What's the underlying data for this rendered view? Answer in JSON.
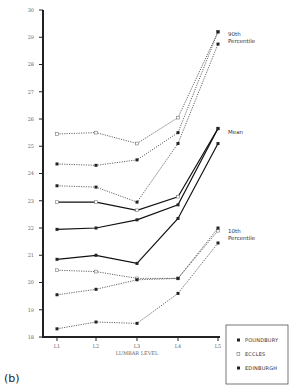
{
  "panel_label": "(b)",
  "chart_data": {
    "type": "line",
    "title": "",
    "xlabel": "LUMBAR LEVEL",
    "ylabel": "",
    "categories": [
      "L1",
      "L2",
      "L3",
      "L4",
      "L5"
    ],
    "ylim": [
      18,
      30
    ],
    "yticks": [
      18,
      19,
      20,
      21,
      22,
      23,
      24,
      25,
      26,
      27,
      28,
      29,
      30
    ],
    "grid": false,
    "legend": {
      "position": "bottom-right",
      "entries": [
        {
          "name": "POUNDBURY",
          "marker": "filled-square"
        },
        {
          "name": "ECCLES",
          "marker": "open-square"
        },
        {
          "name": "EDINBURGH",
          "marker": "filled-square"
        }
      ]
    },
    "annotations": [
      {
        "text_lines": [
          "90th",
          "Percentile"
        ],
        "group": "p90"
      },
      {
        "text_lines": [
          "Mean"
        ],
        "group": "mean"
      },
      {
        "text_lines": [
          "10th",
          "Percentile"
        ],
        "group": "p10"
      }
    ],
    "series": [
      {
        "name": "Eccles 90th",
        "site": "ECCLES",
        "group": "p90",
        "values": [
          25.45,
          25.5,
          25.1,
          26.05,
          29.2
        ]
      },
      {
        "name": "Poundbury 90th",
        "site": "POUNDBURY",
        "group": "p90",
        "values": [
          24.35,
          24.3,
          24.5,
          25.5,
          29.2
        ]
      },
      {
        "name": "Edinburgh 90th",
        "site": "EDINBURGH",
        "group": "p90",
        "values": [
          23.55,
          23.5,
          22.95,
          25.1,
          28.75
        ]
      },
      {
        "name": "Eccles Mean",
        "site": "ECCLES",
        "group": "mean",
        "values": [
          22.95,
          22.95,
          22.65,
          23.15,
          25.65
        ]
      },
      {
        "name": "Poundbury Mean",
        "site": "POUNDBURY",
        "group": "mean",
        "values": [
          21.95,
          22.0,
          22.3,
          22.85,
          25.65
        ]
      },
      {
        "name": "Edinburgh Mean",
        "site": "EDINBURGH",
        "group": "mean",
        "values": [
          20.85,
          21.0,
          20.7,
          22.35,
          25.1
        ]
      },
      {
        "name": "Eccles 10th",
        "site": "ECCLES",
        "group": "p10",
        "values": [
          20.45,
          20.4,
          20.15,
          20.15,
          21.9
        ]
      },
      {
        "name": "Poundbury 10th",
        "site": "POUNDBURY",
        "group": "p10",
        "values": [
          19.55,
          19.75,
          20.1,
          20.15,
          22.0
        ]
      },
      {
        "name": "Edinburgh 10th",
        "site": "EDINBURGH",
        "group": "p10",
        "values": [
          18.3,
          18.55,
          18.5,
          19.6,
          21.45
        ]
      }
    ]
  }
}
